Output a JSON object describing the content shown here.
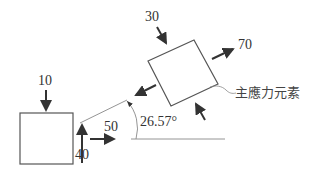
{
  "original_element": {
    "sigma_y_label": "10",
    "tau_label": "40",
    "sigma_x_label": "50"
  },
  "principal_element": {
    "sigma_min_label": "30",
    "sigma_max_label": "70",
    "caption": "主應力元素",
    "angle_label": "26.57°"
  },
  "colors": {
    "stroke": "#333333",
    "thin_line": "#888888"
  }
}
